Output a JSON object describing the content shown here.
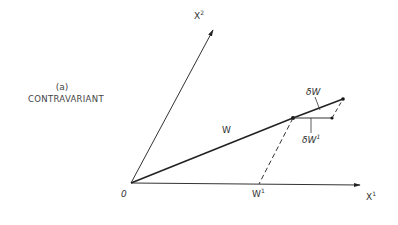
{
  "caption": {
    "panel": "(a)",
    "title": "CONTRAVARIANT"
  },
  "axes": {
    "x1_label": "X",
    "x1_sup": "1",
    "x2_label": "X",
    "x2_sup": "2",
    "origin_label": "0"
  },
  "vectors": {
    "w_label": "W",
    "dw_label": "δW",
    "dw1_label": "δW",
    "dw1_sup": "1",
    "w1_label": "W",
    "w1_sup": "1"
  },
  "colors": {
    "ink": "#222222"
  }
}
